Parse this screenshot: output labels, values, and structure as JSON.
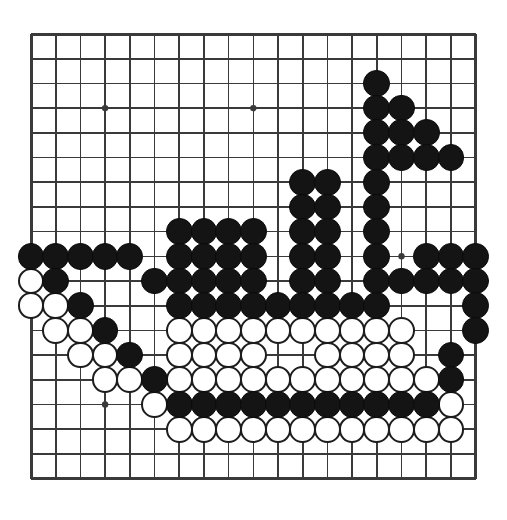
{
  "app": {
    "title": "Go Board Position",
    "board_size": 19,
    "background_color": "#ffffff",
    "line_color": "#3a3a3a",
    "black_stone_color": "#141414",
    "white_stone_color": "#ffffff",
    "white_stone_border_color": "#1d1d1d"
  },
  "board": {
    "size": 19,
    "origin_x": 9,
    "origin_y": 9,
    "spacing": 24.7,
    "star_points": [
      [
        3,
        3
      ],
      [
        9,
        3
      ],
      [
        15,
        3
      ],
      [
        3,
        9
      ],
      [
        9,
        9
      ],
      [
        15,
        9
      ],
      [
        3,
        15
      ],
      [
        9,
        15
      ],
      [
        15,
        15
      ]
    ],
    "visible_star_points": [
      [
        3,
        3
      ],
      [
        9,
        3
      ],
      [
        15,
        9
      ],
      [
        3,
        15
      ]
    ],
    "stones": {
      "black": [
        [
          14,
          2
        ],
        [
          14,
          3
        ],
        [
          15,
          3
        ],
        [
          14,
          4
        ],
        [
          15,
          4
        ],
        [
          16,
          4
        ],
        [
          14,
          5
        ],
        [
          15,
          5
        ],
        [
          16,
          5
        ],
        [
          17,
          5
        ],
        [
          11,
          6
        ],
        [
          12,
          6
        ],
        [
          14,
          6
        ],
        [
          11,
          7
        ],
        [
          12,
          7
        ],
        [
          14,
          7
        ],
        [
          6,
          8
        ],
        [
          7,
          8
        ],
        [
          8,
          8
        ],
        [
          9,
          8
        ],
        [
          11,
          8
        ],
        [
          12,
          8
        ],
        [
          14,
          8
        ],
        [
          0,
          9
        ],
        [
          1,
          9
        ],
        [
          2,
          9
        ],
        [
          3,
          9
        ],
        [
          4,
          9
        ],
        [
          6,
          9
        ],
        [
          7,
          9
        ],
        [
          8,
          9
        ],
        [
          9,
          9
        ],
        [
          11,
          9
        ],
        [
          12,
          9
        ],
        [
          14,
          9
        ],
        [
          16,
          9
        ],
        [
          17,
          9
        ],
        [
          18,
          9
        ],
        [
          1,
          10
        ],
        [
          5,
          10
        ],
        [
          6,
          10
        ],
        [
          7,
          10
        ],
        [
          8,
          10
        ],
        [
          9,
          10
        ],
        [
          11,
          10
        ],
        [
          12,
          10
        ],
        [
          14,
          10
        ],
        [
          15,
          10
        ],
        [
          16,
          10
        ],
        [
          17,
          10
        ],
        [
          18,
          10
        ],
        [
          2,
          11
        ],
        [
          6,
          11
        ],
        [
          7,
          11
        ],
        [
          8,
          11
        ],
        [
          9,
          11
        ],
        [
          10,
          11
        ],
        [
          11,
          11
        ],
        [
          12,
          11
        ],
        [
          13,
          11
        ],
        [
          14,
          11
        ],
        [
          18,
          11
        ],
        [
          3,
          12
        ],
        [
          18,
          12
        ],
        [
          4,
          13
        ],
        [
          17,
          13
        ],
        [
          5,
          14
        ],
        [
          17,
          14
        ],
        [
          6,
          15
        ],
        [
          7,
          15
        ],
        [
          8,
          15
        ],
        [
          9,
          15
        ],
        [
          10,
          15
        ],
        [
          11,
          15
        ],
        [
          12,
          15
        ],
        [
          13,
          15
        ],
        [
          14,
          15
        ],
        [
          15,
          15
        ],
        [
          16,
          15
        ]
      ],
      "white": [
        [
          0,
          10
        ],
        [
          0,
          11
        ],
        [
          1,
          11
        ],
        [
          1,
          12
        ],
        [
          2,
          12
        ],
        [
          6,
          12
        ],
        [
          7,
          12
        ],
        [
          8,
          12
        ],
        [
          9,
          12
        ],
        [
          10,
          12
        ],
        [
          11,
          12
        ],
        [
          12,
          12
        ],
        [
          13,
          12
        ],
        [
          14,
          12
        ],
        [
          15,
          12
        ],
        [
          2,
          13
        ],
        [
          3,
          13
        ],
        [
          6,
          13
        ],
        [
          7,
          13
        ],
        [
          8,
          13
        ],
        [
          9,
          13
        ],
        [
          12,
          13
        ],
        [
          13,
          13
        ],
        [
          14,
          13
        ],
        [
          15,
          13
        ],
        [
          3,
          14
        ],
        [
          4,
          14
        ],
        [
          6,
          14
        ],
        [
          7,
          14
        ],
        [
          8,
          14
        ],
        [
          9,
          14
        ],
        [
          10,
          14
        ],
        [
          11,
          14
        ],
        [
          12,
          14
        ],
        [
          13,
          14
        ],
        [
          14,
          14
        ],
        [
          15,
          14
        ],
        [
          16,
          14
        ],
        [
          5,
          15
        ],
        [
          17,
          15
        ],
        [
          6,
          16
        ],
        [
          7,
          16
        ],
        [
          8,
          16
        ],
        [
          9,
          16
        ],
        [
          10,
          16
        ],
        [
          11,
          16
        ],
        [
          12,
          16
        ],
        [
          13,
          16
        ],
        [
          14,
          16
        ],
        [
          15,
          16
        ],
        [
          16,
          16
        ],
        [
          17,
          16
        ]
      ]
    }
  }
}
